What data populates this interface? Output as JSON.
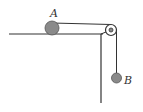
{
  "diagram": {
    "type": "physics-pulley",
    "labels": {
      "a": "A",
      "b": "B"
    },
    "colors": {
      "line": "#333333",
      "ball": "#8a8a8a",
      "ball_stroke": "#555555"
    }
  }
}
